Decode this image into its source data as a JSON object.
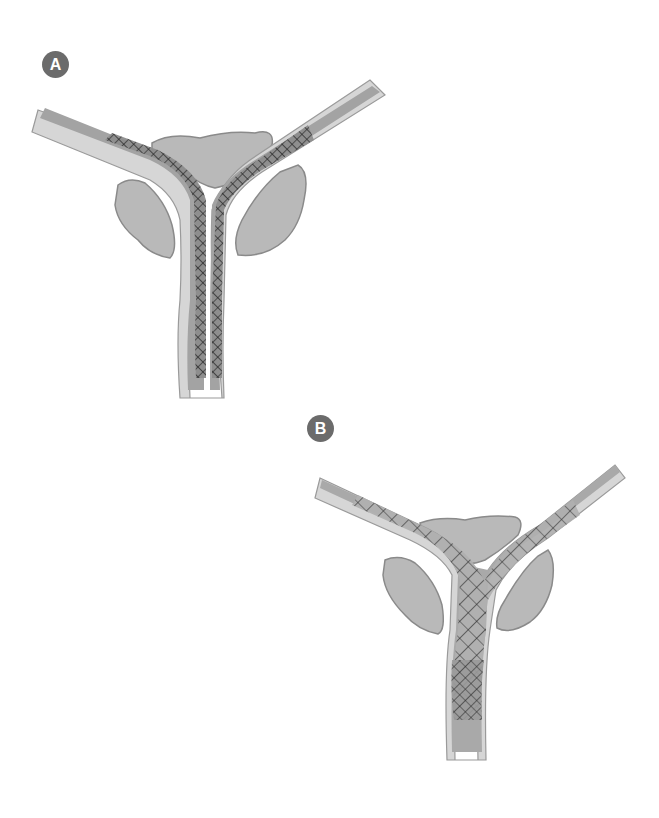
{
  "figure": {
    "panels": [
      {
        "label": "A",
        "description": "Two parallel braided mesh stents placed side-by-side through a Y-shaped bifurcation, each extending into one branch",
        "badge_color": "#6b6b6b"
      },
      {
        "label": "B",
        "description": "Stent-in-stent configuration: one stent passed through the open mesh of another at the Y-shaped bifurcation",
        "badge_color": "#6b6b6b"
      }
    ],
    "colors": {
      "background": "#ffffff",
      "tissue_fill": "#b9b9b9",
      "tissue_outline": "#8a8a8a",
      "tube_wall": "#d8d8d8",
      "tube_lumen": "#a9a9a9",
      "mesh": "#2a2a2a"
    }
  }
}
